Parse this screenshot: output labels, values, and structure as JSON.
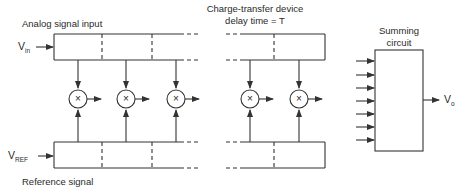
{
  "diagram": {
    "labels": {
      "analog_input": "Analog signal input",
      "ctd_title_line1": "Charge-transfer device",
      "ctd_title_line2": "delay time = T",
      "vin_main": "V",
      "vin_sub": "in",
      "vref_main": "V",
      "vref_sub": "REF",
      "reference_signal": "Reference signal",
      "summing_line1": "Summing",
      "summing_line2": "circuit",
      "vo_main": "V",
      "vo_sub": "o",
      "multiplier_symbol": "×"
    },
    "components": {
      "top_delay_line": {
        "stages_visible_left": 3,
        "stages_visible_right": 2
      },
      "bottom_delay_line": {
        "stages_visible_left": 3,
        "stages_visible_right": 2
      },
      "multipliers": 5,
      "summing_inputs": 7
    },
    "colors": {
      "stroke": "#333333",
      "background": "#ffffff"
    }
  }
}
